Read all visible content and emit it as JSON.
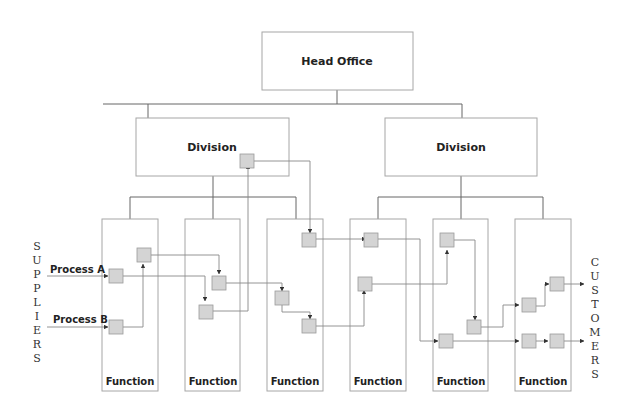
{
  "head_office": {
    "label": "Head Office"
  },
  "divisions": [
    {
      "label": "Division"
    },
    {
      "label": "Division"
    }
  ],
  "functions": [
    {
      "label": "Function"
    },
    {
      "label": "Function"
    },
    {
      "label": "Function"
    },
    {
      "label": "Function"
    },
    {
      "label": "Function"
    },
    {
      "label": "Function"
    }
  ],
  "inputs": {
    "process_a": "Process A",
    "process_b": "Process B"
  },
  "suppliers": [
    "S",
    "U",
    "P",
    "P",
    "L",
    "I",
    "E",
    "R",
    "S"
  ],
  "customers": [
    "C",
    "U",
    "S",
    "T",
    "O",
    "M",
    "E",
    "R",
    "S"
  ],
  "colors": {
    "box_stroke": "#a6a6a6",
    "line": "#555555",
    "node_fill": "#d4d4d4",
    "node_stroke": "#9a9a9a"
  }
}
